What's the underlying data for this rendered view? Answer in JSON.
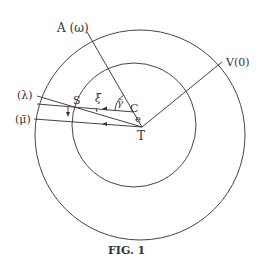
{
  "figure": {
    "caption": "FIG. 1",
    "labels": {
      "A": "A (ω)",
      "V": "V(0)",
      "lambda": "(λ)",
      "mu": "(μ̄)",
      "S": "S",
      "xi": "ξ",
      "gamma": "γ̄",
      "C": "C",
      "e": "e",
      "T": "T"
    }
  }
}
